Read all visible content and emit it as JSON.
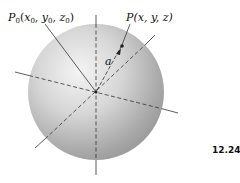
{
  "figure": {
    "number": "12.24",
    "labels": {
      "p0": {
        "main": "P",
        "sub": "0",
        "open": "(",
        "x": "x",
        "y": "y",
        "z": "z",
        "coord_sub": "0",
        "close": ")"
      },
      "p": "P(x, y, z)",
      "a": "a"
    },
    "sphere": {
      "cx": 96,
      "cy": 92,
      "r": 68,
      "light": "#f2f2f2",
      "dark": "#8a8a8a"
    },
    "colors": {
      "line": "#333333"
    }
  }
}
